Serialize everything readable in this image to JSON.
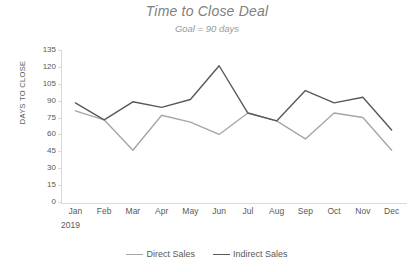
{
  "chart_data": {
    "type": "line",
    "title": "Time to Close Deal",
    "subtitle": "Goal = 90 days",
    "xlabel": "",
    "ylabel": "DAYS TO CLOSE",
    "x_group_label": "2019",
    "categories": [
      "Jan",
      "Feb",
      "Mar",
      "Apr",
      "May",
      "Jun",
      "Jul",
      "Aug",
      "Sep",
      "Oct",
      "Nov",
      "Dec"
    ],
    "ylim": [
      0,
      135
    ],
    "ytick_step": 15,
    "yticks": [
      135,
      120,
      105,
      90,
      75,
      60,
      45,
      30,
      15,
      0
    ],
    "grid": false,
    "legend_position": "bottom",
    "series": [
      {
        "name": "Direct Sales",
        "color": "#a6a6a6",
        "values": [
          81,
          73,
          46,
          77,
          71,
          60,
          79,
          72,
          56,
          79,
          75,
          46
        ]
      },
      {
        "name": "Indirect Sales",
        "color": "#595959",
        "values": [
          88,
          73,
          89,
          84,
          91,
          121,
          79,
          72,
          99,
          88,
          93,
          64
        ]
      }
    ]
  }
}
